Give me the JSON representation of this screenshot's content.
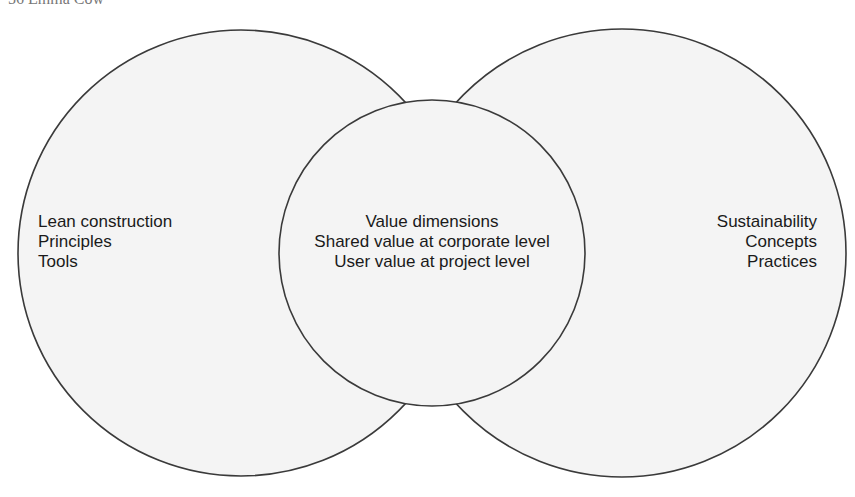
{
  "header": {
    "text": "56   Emma Cow"
  },
  "colors": {
    "circle_fill": "#f4f4f4",
    "circle_stroke": "#3a3a3a",
    "text": "#1a1a1a"
  },
  "diagram": {
    "type": "venn",
    "left_circle": {
      "lines": [
        "Lean construction",
        "Principles",
        "Tools"
      ]
    },
    "center_circle": {
      "lines": [
        "Value dimensions",
        "Shared value at corporate level",
        "User value at project level"
      ]
    },
    "right_circle": {
      "lines": [
        "Sustainability",
        "Concepts",
        "Practices"
      ]
    }
  }
}
